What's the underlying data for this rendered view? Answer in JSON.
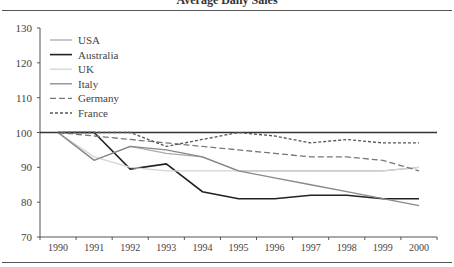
{
  "chart_data": {
    "type": "line",
    "title": "Average Daily Sales",
    "xlabel": "",
    "ylabel": "",
    "ylim": [
      70,
      130
    ],
    "yticks": [
      70,
      80,
      90,
      100,
      110,
      120,
      130
    ],
    "categories": [
      "1990",
      "1991",
      "1992",
      "1993",
      "1994",
      "1995",
      "1996",
      "1997",
      "1998",
      "1999",
      "2000"
    ],
    "reference_line": 100,
    "grid": false,
    "legend_position": "upper-left",
    "series": [
      {
        "name": "USA",
        "style": "solid",
        "color": "#aaaaaa",
        "values": [
          100,
          92,
          96,
          94,
          93,
          89,
          89,
          89,
          89,
          89,
          90
        ]
      },
      {
        "name": "Australia",
        "style": "solid",
        "color": "#222222",
        "values": [
          100,
          100,
          89.5,
          91,
          83,
          81,
          81,
          82,
          82,
          81,
          81
        ]
      },
      {
        "name": "UK",
        "style": "solid",
        "color": "#d4d4d4",
        "values": [
          100,
          93,
          90,
          89,
          89,
          89,
          89,
          89,
          89,
          89,
          90
        ]
      },
      {
        "name": "Italy",
        "style": "solid",
        "color": "#888888",
        "values": [
          100,
          92,
          96,
          95,
          93,
          89,
          87,
          85,
          83,
          81,
          79
        ]
      },
      {
        "name": "Germany",
        "style": "dashed",
        "color": "#777777",
        "values": [
          100,
          99,
          98,
          97,
          96,
          95,
          94,
          93,
          93,
          92,
          89
        ]
      },
      {
        "name": "France",
        "style": "dotted",
        "color": "#555555",
        "values": [
          100,
          100,
          100,
          96,
          98,
          100,
          99,
          97,
          98,
          97,
          97
        ]
      }
    ]
  }
}
